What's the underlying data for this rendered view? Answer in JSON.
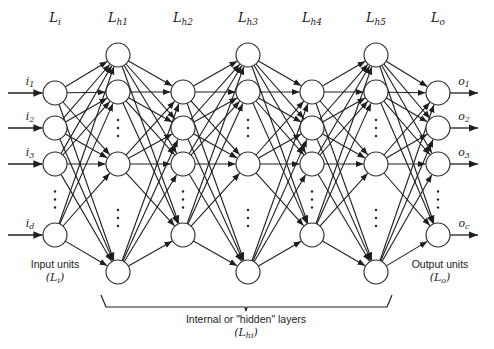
{
  "diagram": {
    "type": "feedforward-neural-network",
    "layers": [
      {
        "id": "Li",
        "label_main": "L",
        "label_sub": "i",
        "x": 55,
        "nodes_y": [
          93,
          128,
          164,
          235
        ],
        "ellipsis_y": [
          [
            176,
            223
          ]
        ]
      },
      {
        "id": "Lh1",
        "label_main": "L",
        "label_sub": "h1",
        "x": 118,
        "nodes_y": [
          55,
          92,
          164,
          272
        ],
        "ellipsis_y": [
          [
            104,
            152
          ],
          [
            176,
            260
          ]
        ]
      },
      {
        "id": "Lh2",
        "label_main": "L",
        "label_sub": "h2",
        "x": 183,
        "nodes_y": [
          92,
          128,
          164,
          235
        ],
        "ellipsis_y": [
          [
            176,
            223
          ]
        ]
      },
      {
        "id": "Lh3",
        "label_main": "L",
        "label_sub": "h3",
        "x": 248,
        "nodes_y": [
          55,
          92,
          164,
          272
        ],
        "ellipsis_y": [
          [
            104,
            152
          ],
          [
            176,
            260
          ]
        ]
      },
      {
        "id": "Lh4",
        "label_main": "L",
        "label_sub": "h4",
        "x": 312,
        "nodes_y": [
          92,
          128,
          164,
          235
        ],
        "ellipsis_y": [
          [
            176,
            223
          ]
        ]
      },
      {
        "id": "Lh5",
        "label_main": "L",
        "label_sub": "h5",
        "x": 376,
        "nodes_y": [
          55,
          92,
          164,
          272
        ],
        "ellipsis_y": [
          [
            104,
            152
          ],
          [
            176,
            260
          ]
        ]
      },
      {
        "id": "Lo",
        "label_main": "L",
        "label_sub": "o",
        "x": 438,
        "nodes_y": [
          93,
          128,
          164,
          235
        ],
        "ellipsis_y": [
          [
            176,
            223
          ]
        ]
      }
    ],
    "node_radius": 12,
    "label_y": 22,
    "inputs": [
      {
        "main": "i",
        "sub": "1"
      },
      {
        "main": "i",
        "sub": "2"
      },
      {
        "main": "i",
        "sub": "3"
      },
      {
        "main": "i",
        "sub": "d"
      }
    ],
    "outputs": [
      {
        "main": "o",
        "sub": "1"
      },
      {
        "main": "o",
        "sub": "2"
      },
      {
        "main": "o",
        "sub": "3"
      },
      {
        "main": "o",
        "sub": "c"
      }
    ],
    "input_caption": {
      "line1": "Input units",
      "line2_main": "L",
      "line2_sub": "i"
    },
    "output_caption": {
      "line1": "Output units",
      "line2_main": "L",
      "line2_sub": "o"
    },
    "hidden_caption": {
      "line1": "Internal or \"hidden\" layers",
      "line2_main": "L",
      "line2_sub": "hi"
    },
    "connectivity": "fully-connected-adjacent-layers",
    "colors": {
      "stroke": "#1e1e1e",
      "node_fill": "#ffffff",
      "background": "#ffffff"
    }
  }
}
